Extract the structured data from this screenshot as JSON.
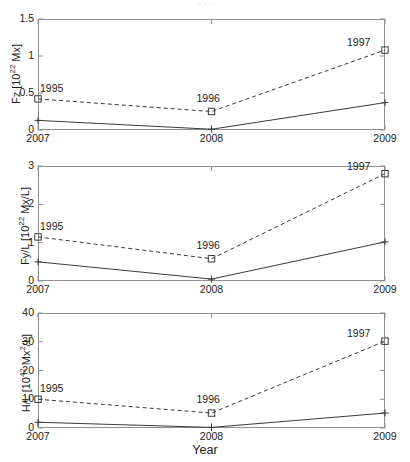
{
  "figure": {
    "width": 410,
    "height": 462,
    "xlabel": "Year",
    "cropped_top_text": "· · ·"
  },
  "chart_data": [
    {
      "type": "line",
      "title": "",
      "panel_id": "fz",
      "xlabel": "",
      "ylabel": "Fz [10^22 Mx]",
      "ylabel_base": "Fz [10",
      "ylabel_exp": "22",
      "ylabel_tail": " Mx]",
      "x": [
        2007,
        2008,
        2009
      ],
      "xtick_labels": [
        "2007",
        "2008",
        "2009"
      ],
      "xlim": [
        2007,
        2009
      ],
      "ylim": [
        0,
        1.5
      ],
      "yticks": [
        0,
        0.5,
        1,
        1.5
      ],
      "ytick_labels": [
        "0",
        "0.5",
        "1",
        "1.5"
      ],
      "grid": false,
      "legend": "none",
      "series": [
        {
          "name": "solid",
          "style": "solid",
          "marker": "plus",
          "values": [
            0.13,
            0.01,
            0.37
          ],
          "annotations": [
            "",
            "",
            ""
          ]
        },
        {
          "name": "dashed",
          "style": "dashed",
          "marker": "square",
          "values": [
            0.42,
            0.25,
            1.08
          ],
          "annotations": [
            "1995",
            "1996",
            "1997"
          ]
        }
      ]
    },
    {
      "type": "line",
      "title": "",
      "panel_id": "fyl",
      "xlabel": "",
      "ylabel": "Fy/L [10^22 Mx/L]",
      "ylabel_base": "Fy/L [10",
      "ylabel_exp": "22",
      "ylabel_tail": " Mx/L]",
      "x": [
        2007,
        2008,
        2009
      ],
      "xtick_labels": [
        "2007",
        "2008",
        "2009"
      ],
      "xlim": [
        2007,
        2009
      ],
      "ylim": [
        0,
        3
      ],
      "yticks": [
        0,
        1,
        2,
        3
      ],
      "ytick_labels": [
        "0",
        "1",
        "2",
        "3"
      ],
      "grid": false,
      "legend": "none",
      "series": [
        {
          "name": "solid",
          "style": "solid",
          "marker": "plus",
          "values": [
            0.5,
            0.05,
            1.02
          ],
          "annotations": [
            "",
            "",
            ""
          ]
        },
        {
          "name": "dashed",
          "style": "dashed",
          "marker": "square",
          "values": [
            1.15,
            0.58,
            2.8
          ],
          "annotations": [
            "1995",
            "1996",
            "1997"
          ]
        }
      ]
    },
    {
      "type": "line",
      "title": "",
      "panel_id": "hl",
      "xlabel": "Year",
      "ylabel": "H/L [10^42 Mx^2/L]",
      "ylabel_base": "H/L [10",
      "ylabel_exp": "42",
      "ylabel_mid": " Mx",
      "ylabel_exp2": "2",
      "ylabel_tail": "/L]",
      "x": [
        2007,
        2008,
        2009
      ],
      "xtick_labels": [
        "2007",
        "2008",
        "2009"
      ],
      "xlim": [
        2007,
        2009
      ],
      "ylim": [
        0,
        40
      ],
      "yticks": [
        0,
        10,
        20,
        30,
        40
      ],
      "ytick_labels": [
        "0",
        "10",
        "20",
        "30",
        "40"
      ],
      "grid": false,
      "legend": "none",
      "series": [
        {
          "name": "solid",
          "style": "solid",
          "marker": "plus",
          "values": [
            2.0,
            0.2,
            5.2
          ],
          "annotations": [
            "",
            "",
            ""
          ]
        },
        {
          "name": "dashed",
          "style": "dashed",
          "marker": "square",
          "values": [
            10.0,
            5.2,
            30.2
          ],
          "annotations": [
            "1995",
            "1996",
            "1997"
          ]
        }
      ]
    }
  ]
}
